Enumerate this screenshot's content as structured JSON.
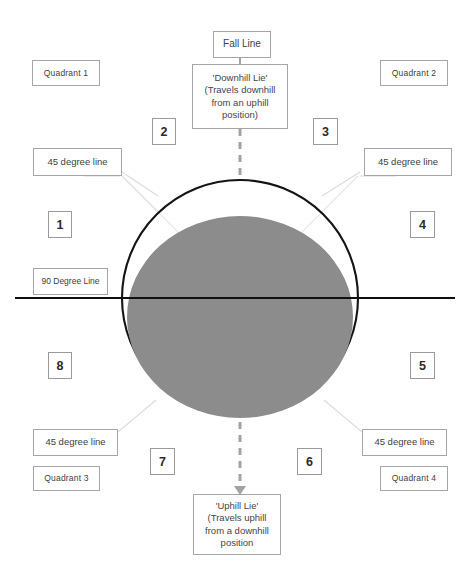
{
  "diagram": {
    "colors": {
      "ball_fill": "#8c8c8c",
      "outline": "#1a1a1a",
      "box_border": "#a6a6a6",
      "leader_line": "#d9d9d9",
      "dashed_line": "#a3a3a3",
      "background": "#ffffff"
    },
    "shapes": {
      "outer_circle": {
        "cx": 240,
        "cy": 298,
        "r": 118
      },
      "inner_ellipse": {
        "cx": 240,
        "cy": 317,
        "rx": 113,
        "ry": 101
      },
      "horizontal_line": {
        "x1": 15,
        "y1": 298,
        "x2": 455,
        "y2": 298
      },
      "vertical_dashed_top": {
        "x": 240,
        "y1": 129,
        "y2": 178
      },
      "vertical_dashed_bottom": {
        "x": 240,
        "y1": 422,
        "y2": 492
      }
    },
    "labels": {
      "fall_line": "Fall Line",
      "downhill_lie": "'Downhill Lie'\n(Travels downhill\nfrom an uphill\nposition)",
      "uphill_lie": "'Uphill Lie'\n(Travels uphill\nfrom a downhill\nposition",
      "degree_90": "90 Degree Line",
      "degree_45": "45 degree line",
      "quadrant_1": "Quadrant  1",
      "quadrant_2": "Quadrant  2",
      "quadrant_3": "Quadrant  3",
      "quadrant_4": "Quadrant  4"
    },
    "sector_numbers": {
      "s1": "1",
      "s2": "2",
      "s3": "3",
      "s4": "4",
      "s5": "5",
      "s6": "6",
      "s7": "7",
      "s8": "8"
    }
  }
}
